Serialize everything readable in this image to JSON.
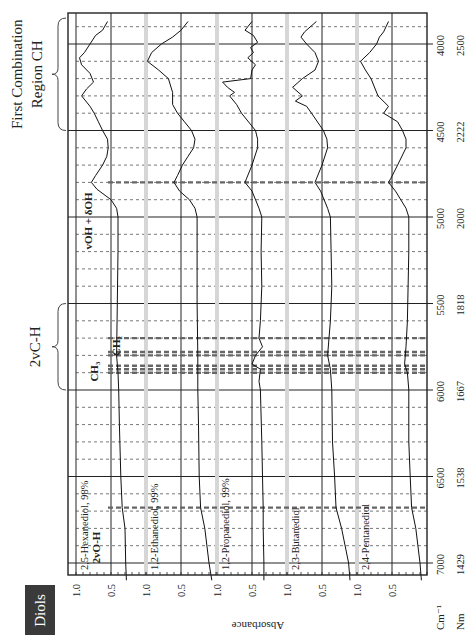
{
  "header": {
    "category_label": "Diols"
  },
  "chart_data": {
    "type": "line",
    "orientation": "rotated-90-clockwise",
    "title": "",
    "xlabel_units": [
      "Cm⁻¹",
      "Nm"
    ],
    "ylabel": "Absorbance",
    "x_ticks_cm": [
      4000,
      4500,
      5000,
      5500,
      6000,
      6500,
      7000
    ],
    "x_ticks_nm": [
      2500,
      2222,
      2000,
      1818,
      1667,
      1538,
      1429
    ],
    "x_range_cm": [
      3850,
      7150
    ],
    "y_ticks": [
      "1.0",
      "0.5"
    ],
    "grid": {
      "major_solid_every_cm": 500,
      "minor_dashed_every_cm": 100
    },
    "region_annotations": [
      {
        "label": "First Combination Region CH",
        "label_lines": [
          "First Combination",
          "Region CH"
        ],
        "from_cm": 3850,
        "to_cm": 4500
      },
      {
        "label": "2vC-H",
        "from_cm": 5500,
        "to_cm": 6000
      }
    ],
    "band_annotations": [
      {
        "label": "vOH + δOH",
        "cm": 4800
      },
      {
        "label": "CH₂",
        "cm": 5700,
        "extra_cm": [
          5780,
          5800
        ]
      },
      {
        "label": "CH₃",
        "cm": 5860,
        "extra_cm": [
          5880,
          5900
        ]
      },
      {
        "label": "2vO-H",
        "cm": 6680
      }
    ],
    "series": [
      {
        "name": "2,5-Hexanediol, 98%",
        "points": [
          [
            3870,
            0.55
          ],
          [
            3920,
            0.62
          ],
          [
            3950,
            0.72
          ],
          [
            4000,
            0.8
          ],
          [
            4050,
            0.88
          ],
          [
            4080,
            0.95
          ],
          [
            4120,
            0.92
          ],
          [
            4170,
            0.8
          ],
          [
            4220,
            0.75
          ],
          [
            4260,
            0.85
          ],
          [
            4300,
            0.92
          ],
          [
            4360,
            0.8
          ],
          [
            4400,
            0.74
          ],
          [
            4450,
            0.68
          ],
          [
            4500,
            0.62
          ],
          [
            4550,
            0.55
          ],
          [
            4600,
            0.54
          ],
          [
            4650,
            0.56
          ],
          [
            4700,
            0.62
          ],
          [
            4760,
            0.72
          ],
          [
            4800,
            0.78
          ],
          [
            4840,
            0.7
          ],
          [
            4900,
            0.5
          ],
          [
            4950,
            0.42
          ],
          [
            5000,
            0.4
          ],
          [
            5200,
            0.4
          ],
          [
            5500,
            0.41
          ],
          [
            5800,
            0.42
          ],
          [
            5900,
            0.4
          ],
          [
            6000,
            0.39
          ],
          [
            6200,
            0.38
          ],
          [
            6500,
            0.36
          ],
          [
            6680,
            0.34
          ],
          [
            6800,
            0.3
          ],
          [
            7000,
            0.29
          ],
          [
            7100,
            0.28
          ]
        ]
      },
      {
        "name": "1,2-Ethanediol, 99%",
        "points": [
          [
            3870,
            0.4
          ],
          [
            3920,
            0.5
          ],
          [
            3960,
            0.62
          ],
          [
            4000,
            0.78
          ],
          [
            4050,
            0.92
          ],
          [
            4100,
            0.98
          ],
          [
            4150,
            0.82
          ],
          [
            4200,
            0.68
          ],
          [
            4280,
            0.62
          ],
          [
            4350,
            0.62
          ],
          [
            4400,
            0.55
          ],
          [
            4450,
            0.45
          ],
          [
            4500,
            0.35
          ],
          [
            4550,
            0.3
          ],
          [
            4600,
            0.32
          ],
          [
            4650,
            0.4
          ],
          [
            4700,
            0.48
          ],
          [
            4760,
            0.55
          ],
          [
            4800,
            0.6
          ],
          [
            4850,
            0.52
          ],
          [
            4900,
            0.38
          ],
          [
            4950,
            0.3
          ],
          [
            5000,
            0.27
          ],
          [
            5200,
            0.27
          ],
          [
            5500,
            0.27
          ],
          [
            5800,
            0.26
          ],
          [
            6000,
            0.26
          ],
          [
            6200,
            0.25
          ],
          [
            6500,
            0.24
          ],
          [
            6680,
            0.22
          ],
          [
            6800,
            0.16
          ],
          [
            7000,
            0.1
          ],
          [
            7100,
            0.06
          ]
        ]
      },
      {
        "name": "1,2-Propanediol, 99%",
        "points": [
          [
            3870,
            0.5
          ],
          [
            3920,
            0.6
          ],
          [
            3950,
            0.48
          ],
          [
            3990,
            0.42
          ],
          [
            4020,
            0.52
          ],
          [
            4050,
            0.48
          ],
          [
            4080,
            0.56
          ],
          [
            4120,
            0.45
          ],
          [
            4150,
            0.5
          ],
          [
            4200,
            0.52
          ],
          [
            4220,
            0.92
          ],
          [
            4250,
            0.85
          ],
          [
            4280,
            0.75
          ],
          [
            4300,
            0.82
          ],
          [
            4350,
            0.72
          ],
          [
            4400,
            0.65
          ],
          [
            4500,
            0.45
          ],
          [
            4550,
            0.42
          ],
          [
            4600,
            0.42
          ],
          [
            4700,
            0.5
          ],
          [
            4780,
            0.58
          ],
          [
            4800,
            0.6
          ],
          [
            4850,
            0.5
          ],
          [
            4950,
            0.4
          ],
          [
            5000,
            0.36
          ],
          [
            5200,
            0.37
          ],
          [
            5400,
            0.36
          ],
          [
            5600,
            0.38
          ],
          [
            5700,
            0.4
          ],
          [
            5750,
            0.35
          ],
          [
            5800,
            0.45
          ],
          [
            5850,
            0.5
          ],
          [
            5880,
            0.38
          ],
          [
            5950,
            0.4
          ],
          [
            6000,
            0.38
          ],
          [
            6300,
            0.36
          ],
          [
            6500,
            0.35
          ],
          [
            6680,
            0.34
          ],
          [
            6800,
            0.34
          ],
          [
            7000,
            0.33
          ],
          [
            7100,
            0.33
          ]
        ]
      },
      {
        "name": "2,3-Butanediol",
        "points": [
          [
            3870,
            0.58
          ],
          [
            3930,
            0.75
          ],
          [
            3960,
            0.8
          ],
          [
            4000,
            0.72
          ],
          [
            4050,
            0.6
          ],
          [
            4100,
            0.55
          ],
          [
            4150,
            0.6
          ],
          [
            4200,
            0.78
          ],
          [
            4250,
            0.92
          ],
          [
            4300,
            0.78
          ],
          [
            4330,
            0.88
          ],
          [
            4360,
            0.72
          ],
          [
            4400,
            0.65
          ],
          [
            4500,
            0.48
          ],
          [
            4550,
            0.43
          ],
          [
            4600,
            0.42
          ],
          [
            4700,
            0.5
          ],
          [
            4780,
            0.58
          ],
          [
            4800,
            0.6
          ],
          [
            4850,
            0.52
          ],
          [
            4950,
            0.42
          ],
          [
            5000,
            0.38
          ],
          [
            5200,
            0.37
          ],
          [
            5400,
            0.36
          ],
          [
            5600,
            0.38
          ],
          [
            5700,
            0.4
          ],
          [
            5800,
            0.42
          ],
          [
            5880,
            0.38
          ],
          [
            6000,
            0.36
          ],
          [
            6300,
            0.35
          ],
          [
            6500,
            0.32
          ],
          [
            6680,
            0.3
          ],
          [
            6800,
            0.22
          ],
          [
            7000,
            0.12
          ],
          [
            7100,
            0.1
          ]
        ]
      },
      {
        "name": "2,4-Pentanediol",
        "points": [
          [
            3870,
            0.55
          ],
          [
            3930,
            0.62
          ],
          [
            3960,
            0.68
          ],
          [
            4000,
            0.72
          ],
          [
            4050,
            0.82
          ],
          [
            4100,
            0.95
          ],
          [
            4150,
            0.88
          ],
          [
            4200,
            0.8
          ],
          [
            4260,
            0.74
          ],
          [
            4300,
            0.7
          ],
          [
            4360,
            0.55
          ],
          [
            4400,
            0.62
          ],
          [
            4450,
            0.42
          ],
          [
            4500,
            0.35
          ],
          [
            4550,
            0.3
          ],
          [
            4600,
            0.3
          ],
          [
            4700,
            0.42
          ],
          [
            4780,
            0.52
          ],
          [
            4800,
            0.55
          ],
          [
            4850,
            0.45
          ],
          [
            4950,
            0.3
          ],
          [
            5000,
            0.26
          ],
          [
            5200,
            0.26
          ],
          [
            5400,
            0.27
          ],
          [
            5600,
            0.28
          ],
          [
            5750,
            0.3
          ],
          [
            5850,
            0.32
          ],
          [
            5900,
            0.28
          ],
          [
            6000,
            0.26
          ],
          [
            6300,
            0.26
          ],
          [
            6500,
            0.24
          ],
          [
            6680,
            0.22
          ],
          [
            6800,
            0.16
          ],
          [
            7000,
            0.1
          ],
          [
            7100,
            0.08
          ]
        ]
      }
    ]
  }
}
